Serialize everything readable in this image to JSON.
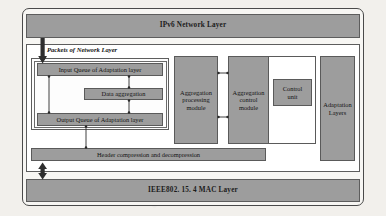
{
  "diagram": {
    "type": "block-diagram",
    "colors": {
      "block_fill": "#9d9d9d",
      "block_stroke": "#5a5a5a",
      "panel_fill": "#ffffff",
      "page_background": "#f2f0ec",
      "frame_stroke": "#4a4a4a",
      "text": "#141414"
    }
  },
  "layers": {
    "network_layer": "IPv6  Network Layer",
    "mac_layer": "IEEE802. 15. 4  MAC Layer"
  },
  "annotations": {
    "packets_label": "Packets of Network Layer"
  },
  "adaptation": {
    "side_label_line1": "Adaptation",
    "side_label_line2": "Layers",
    "header_compression": "Header compression and decompression"
  },
  "queues": {
    "input_queue": "Input Queue of Adaptation layer",
    "data_aggregation": "Data aggregation",
    "output_queue": "Output Queue of Adaptation layer"
  },
  "modules": {
    "aggregation_processing": {
      "line1": "Aggregation",
      "line2": "processing",
      "line3": "module"
    },
    "aggregation_control": {
      "line1": "Aggregation",
      "line2": "control",
      "line3": "module"
    },
    "control_unit": {
      "line1": "Control",
      "line2": "unit"
    }
  }
}
